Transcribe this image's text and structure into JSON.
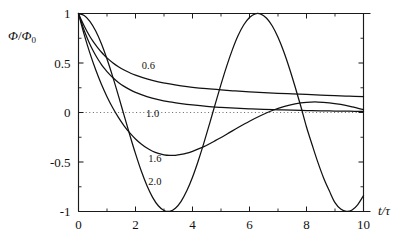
{
  "figure": {
    "background_color": "#ffffff",
    "line_color": "#111111",
    "zero_line_color": "#555555"
  },
  "chart_data": {
    "type": "line",
    "title": "",
    "subtitle": "",
    "xlabel": "t/τ",
    "ylabel": "Φ/Φ₀",
    "xlim": [
      0,
      10
    ],
    "ylim": [
      -1,
      1
    ],
    "xticks": [
      0,
      2,
      4,
      6,
      8,
      10
    ],
    "xticklabels": [
      "0",
      "2",
      "4",
      "6",
      "8",
      "10"
    ],
    "xminorticks": [
      1,
      3,
      5,
      7,
      9
    ],
    "yticks": [
      -1,
      -0.5,
      0,
      0.5,
      1
    ],
    "yticklabels": [
      "-1",
      "-0.5",
      "0",
      "0.5",
      "1"
    ],
    "yminorticks": [
      -0.75,
      -0.25,
      0.25,
      0.75
    ],
    "grid": false,
    "legend_position": "inline-annotations",
    "zero_reference_line": {
      "y": 0,
      "style": "dotted",
      "x_start": 0,
      "x_end": 10
    },
    "annotations": [
      {
        "text": "0.6",
        "x": 2.45,
        "y": 0.435
      },
      {
        "text": "1.0",
        "x": 2.6,
        "y": -0.05
      },
      {
        "text": "1.6",
        "x": 2.68,
        "y": -0.495
      },
      {
        "text": "2.0",
        "x": 2.68,
        "y": -0.73
      }
    ],
    "series": [
      {
        "name": "0.6",
        "label": "0.6",
        "damping": 0.6,
        "x": [
          0,
          0.1,
          0.2,
          0.3,
          0.4,
          0.5,
          0.6,
          0.7,
          0.8,
          0.9,
          1.0,
          1.2,
          1.4,
          1.6,
          1.8,
          2.0,
          2.4,
          2.8,
          3.2,
          3.6,
          4.0,
          4.5,
          5.0,
          5.5,
          6.0,
          6.5,
          7.0,
          7.5,
          8.0,
          8.5,
          9.0,
          9.5,
          10.0
        ],
        "values": [
          1.0,
          0.933,
          0.873,
          0.818,
          0.768,
          0.723,
          0.682,
          0.645,
          0.611,
          0.58,
          0.552,
          0.503,
          0.463,
          0.429,
          0.401,
          0.377,
          0.339,
          0.31,
          0.288,
          0.27,
          0.255,
          0.24,
          0.228,
          0.218,
          0.209,
          0.201,
          0.194,
          0.188,
          0.182,
          0.176,
          0.17,
          0.165,
          0.16
        ]
      },
      {
        "name": "1.0",
        "label": "1.0",
        "damping": 1.0,
        "x": [
          0,
          0.1,
          0.2,
          0.3,
          0.4,
          0.5,
          0.6,
          0.7,
          0.8,
          0.9,
          1.0,
          1.2,
          1.4,
          1.6,
          1.8,
          2.0,
          2.4,
          2.8,
          3.2,
          3.6,
          4.0,
          4.5,
          5.0,
          5.5,
          6.0,
          6.5,
          7.0,
          7.5,
          8.0,
          8.5,
          9.0,
          9.5,
          10.0
        ],
        "values": [
          1.0,
          0.91,
          0.829,
          0.756,
          0.69,
          0.631,
          0.578,
          0.53,
          0.487,
          0.448,
          0.413,
          0.353,
          0.304,
          0.264,
          0.231,
          0.203,
          0.161,
          0.13,
          0.107,
          0.09,
          0.076,
          0.062,
          0.052,
          0.044,
          0.037,
          0.031,
          0.027,
          0.023,
          0.02,
          0.017,
          0.015,
          0.013,
          0.011
        ]
      },
      {
        "name": "1.6",
        "label": "1.6",
        "damping": 1.6,
        "x": [
          0,
          0.2,
          0.4,
          0.6,
          0.8,
          1.0,
          1.2,
          1.4,
          1.6,
          1.8,
          2.0,
          2.2,
          2.4,
          2.6,
          2.8,
          3.0,
          3.2,
          3.4,
          3.6,
          3.8,
          4.0,
          4.4,
          4.8,
          5.2,
          5.6,
          6.0,
          6.4,
          6.8,
          7.2,
          7.6,
          8.0,
          8.4,
          8.8,
          9.2,
          9.6,
          10.0
        ],
        "values": [
          1.0,
          0.787,
          0.6,
          0.434,
          0.288,
          0.16,
          0.048,
          -0.049,
          -0.134,
          -0.206,
          -0.267,
          -0.318,
          -0.359,
          -0.391,
          -0.413,
          -0.427,
          -0.433,
          -0.432,
          -0.424,
          -0.411,
          -0.392,
          -0.344,
          -0.284,
          -0.219,
          -0.152,
          -0.088,
          -0.03,
          0.02,
          0.06,
          0.088,
          0.103,
          0.106,
          0.098,
          0.081,
          0.057,
          0.029
        ]
      },
      {
        "name": "2.0",
        "label": "2.0",
        "damping": 2.0,
        "x": [
          0,
          0.2,
          0.4,
          0.6,
          0.8,
          1.0,
          1.2,
          1.4,
          1.6,
          1.8,
          2.0,
          2.2,
          2.4,
          2.6,
          2.8,
          3.0,
          3.2,
          3.4,
          3.6,
          3.8,
          4.0,
          4.2,
          4.4,
          4.6,
          4.8,
          5.0,
          5.2,
          5.4,
          5.6,
          5.8,
          6.0,
          6.2,
          6.4,
          6.6,
          6.8,
          7.0,
          7.2,
          7.4,
          7.6,
          7.8,
          8.0,
          8.2,
          8.4,
          8.6,
          8.8,
          9.0,
          9.2,
          9.4,
          9.6,
          9.8,
          10.0
        ],
        "values": [
          1.0,
          0.98,
          0.921,
          0.825,
          0.697,
          0.54,
          0.362,
          0.17,
          -0.029,
          -0.227,
          -0.416,
          -0.589,
          -0.737,
          -0.857,
          -0.942,
          -0.99,
          -0.998,
          -0.967,
          -0.897,
          -0.791,
          -0.654,
          -0.49,
          -0.307,
          -0.112,
          0.087,
          0.284,
          0.469,
          0.635,
          0.777,
          0.886,
          0.96,
          0.997,
          0.994,
          0.952,
          0.874,
          0.76,
          0.616,
          0.447,
          0.26,
          0.063,
          -0.146,
          -0.328,
          -0.504,
          -0.661,
          -0.791,
          -0.911,
          -0.975,
          -0.999,
          -0.985,
          -0.93,
          -0.839
        ]
      }
    ]
  }
}
